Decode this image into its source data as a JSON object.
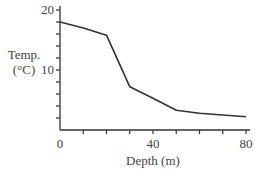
{
  "chart_data": {
    "type": "line",
    "title": "",
    "xlabel": "Depth (m)",
    "ylabel_line1": "Temp.",
    "ylabel_line2": "(°C)",
    "ylabel": "Temp. (°C)",
    "xlim": [
      0,
      80
    ],
    "ylim": [
      0,
      20
    ],
    "x_tick_labels": [
      "0",
      "40",
      "80"
    ],
    "x_minor_ticks": [
      10,
      20,
      30,
      40,
      50,
      60,
      70,
      80
    ],
    "y_tick_labels": [
      "20",
      "10"
    ],
    "y_minor_ticks": [
      2,
      4,
      6,
      8,
      10,
      12,
      14,
      16,
      18,
      20
    ],
    "grid": false,
    "legend": null,
    "series": [
      {
        "name": "Temperature",
        "x": [
          0,
          10,
          20,
          30,
          40,
          50,
          60,
          80
        ],
        "values": [
          18,
          17,
          15.8,
          7.2,
          5.3,
          3.3,
          2.8,
          2.2
        ]
      }
    ],
    "line_color": "#333333"
  }
}
